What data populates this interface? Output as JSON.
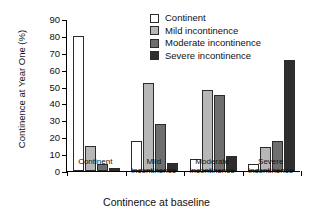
{
  "chart_data": {
    "type": "bar",
    "title": "",
    "xlabel": "Continence at baseline",
    "ylabel": "Continence at Year One (%)",
    "categories": [
      "Continent",
      "Mild incontinence",
      "Moderate incontinence",
      "Severe incontinence"
    ],
    "category_lines": [
      [
        "Continent",
        ""
      ],
      [
        "Mild",
        "incontinence"
      ],
      [
        "Moderate",
        "incontinence"
      ],
      [
        "Severe",
        "incontinence"
      ]
    ],
    "series": [
      {
        "name": "Continent",
        "color": "#ffffff",
        "values": [
          80,
          18,
          7,
          4
        ]
      },
      {
        "name": "Mild incontinence",
        "color": "#b7b7b7",
        "values": [
          15,
          52,
          48,
          14
        ]
      },
      {
        "name": "Moderate incontinence",
        "color": "#6e6e6e",
        "values": [
          4,
          28,
          45,
          18
        ]
      },
      {
        "name": "Severe incontinence",
        "color": "#2e2e2e",
        "values": [
          2,
          5,
          9,
          66
        ]
      }
    ],
    "ylim": [
      0,
      90
    ],
    "yticks": [
      0,
      10,
      20,
      30,
      40,
      50,
      60,
      70,
      80,
      90
    ],
    "ytick_labels": [
      "0",
      "10",
      "20",
      "30",
      "40",
      "50",
      "60",
      "70",
      "80",
      "90"
    ],
    "grid": false,
    "legend_position": "top-right",
    "legend": [
      "Continent",
      "Mild incontinence",
      "Moderate incontinence",
      "Severe incontinence"
    ]
  }
}
